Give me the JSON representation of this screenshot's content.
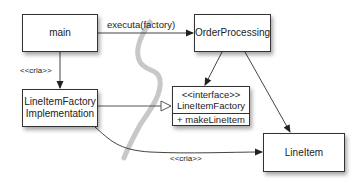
{
  "diagram": {
    "type": "uml-class-dependency",
    "nodes": {
      "main": {
        "label": "main"
      },
      "order_processing": {
        "label": "OrderProcessing"
      },
      "factory_impl": {
        "label_line1": "LineItemFactory",
        "label_line2": "Implementation"
      },
      "factory_interface": {
        "stereotype": "<<interface>>",
        "name": "LineItemFactory",
        "operation": "+ makeLineItem"
      },
      "line_item": {
        "label": "LineItem"
      }
    },
    "edges": {
      "main_to_order": {
        "label": "executa(factory)"
      },
      "main_to_impl": {
        "label": "<<cria>>"
      },
      "impl_to_lineitem": {
        "label": "<<cria>>"
      }
    },
    "colors": {
      "line": "#333333",
      "boundary_stroke": "#c8c8c8"
    }
  }
}
